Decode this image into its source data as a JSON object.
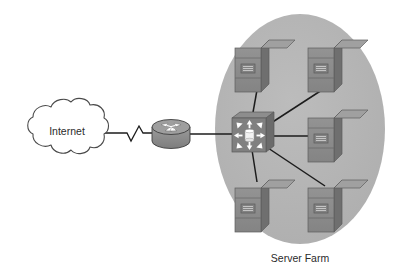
{
  "diagram": {
    "type": "network-topology",
    "title_visible": false,
    "background_color": "#ffffff",
    "nodes": [
      {
        "id": "internet-cloud",
        "icon": "cloud-icon",
        "label": "Internet",
        "shape": "cloud",
        "fill": "#ffffff",
        "stroke": "#4a4a4a",
        "x": 62,
        "y": 131
      },
      {
        "id": "router",
        "icon": "router-icon",
        "label": "",
        "shape": "cylinder-with-arrows",
        "fill": "#8d8d8d",
        "stroke": "#3a3a3a",
        "x": 171,
        "y": 133
      },
      {
        "id": "switch",
        "icon": "switch-icon",
        "label": "",
        "shape": "box-with-radiating-arrows",
        "fill": "#7e7e7e",
        "stroke": "#4a4a4a",
        "x": 251,
        "y": 134
      },
      {
        "id": "server-top-left",
        "icon": "server-icon",
        "label": "",
        "x": 261,
        "y": 64
      },
      {
        "id": "server-top-right",
        "icon": "server-icon",
        "label": "",
        "x": 334,
        "y": 64
      },
      {
        "id": "server-middle-right",
        "icon": "server-icon",
        "label": "",
        "x": 334,
        "y": 134
      },
      {
        "id": "server-bottom-left",
        "icon": "server-icon",
        "label": "",
        "x": 261,
        "y": 204
      },
      {
        "id": "server-bottom-right",
        "icon": "server-icon",
        "label": "",
        "x": 334,
        "y": 204
      }
    ],
    "links": [
      {
        "id": "link-cloud-router",
        "from": "internet-cloud",
        "to": "router",
        "style": "serial-zigzag"
      },
      {
        "id": "link-router-switch",
        "from": "router",
        "to": "switch",
        "style": "solid"
      },
      {
        "id": "link-switch-server-top-left",
        "from": "switch",
        "to": "server-top-left",
        "style": "solid"
      },
      {
        "id": "link-switch-server-top-right",
        "from": "switch",
        "to": "server-top-right",
        "style": "solid"
      },
      {
        "id": "link-switch-server-middle-right",
        "from": "switch",
        "to": "server-middle-right",
        "style": "solid"
      },
      {
        "id": "link-switch-server-bottom-left",
        "from": "switch",
        "to": "server-bottom-left",
        "style": "solid"
      },
      {
        "id": "link-switch-server-bottom-right",
        "from": "switch",
        "to": "server-bottom-right",
        "style": "solid"
      }
    ],
    "groups": [
      {
        "id": "server-farm-group",
        "label": "Server Farm",
        "shape": "ellipse",
        "fill": "#b2b2b2",
        "cx": 300,
        "cy": 129,
        "rx": 85,
        "ry": 115,
        "label_x": 300,
        "label_y": 259
      }
    ],
    "colors": {
      "group_fill": "#b2b2b2",
      "server_body": "#8a8a8a",
      "server_side": "#6d6d6d",
      "server_top": "#9a9a9a",
      "server_panel": "#777777",
      "line": "#1c1c1c",
      "cloud_stroke": "#4a4a4a",
      "text": "#2b2b2b",
      "switch_body": "#7e7e7e",
      "router_body": "#8d8d8d"
    }
  },
  "labels": {
    "internet": "Internet",
    "server_farm": "Server Farm"
  }
}
